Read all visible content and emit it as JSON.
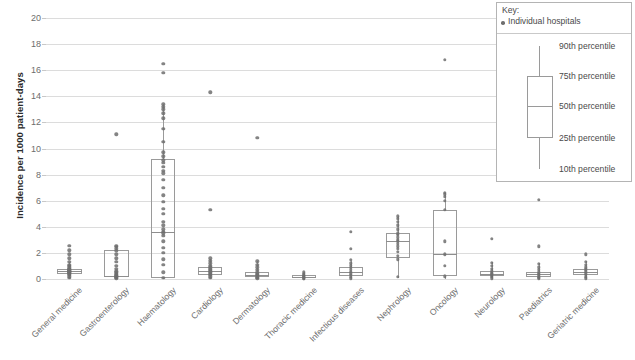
{
  "chart_data": {
    "type": "box",
    "title": "",
    "xlabel": "",
    "ylabel": "Incidence per 1000 patient-days",
    "ylim": [
      0,
      20
    ],
    "ytick_values": [
      0,
      2,
      4,
      6,
      8,
      10,
      12,
      14,
      16,
      18,
      20
    ],
    "ytick_labels": [
      "0",
      "2",
      "4",
      "6",
      "8",
      "10",
      "12",
      "14",
      "16",
      "18",
      "20"
    ],
    "grid": true,
    "legend_position": "top-right",
    "categories": [
      "General medicine",
      "Gastroenterology",
      "Haematology",
      "Cardiology",
      "Dermatology",
      "Thoracic medicine",
      "Infectious diseases",
      "Nephrology",
      "Oncology",
      "Neurology",
      "Paediatrics",
      "Geriatric medicine"
    ],
    "boxes": [
      {
        "category": "General medicine",
        "p10": 0.0,
        "p25": 0.35,
        "p50": 0.6,
        "p75": 0.8,
        "p90": 1.3,
        "points": [
          0.1,
          0.2,
          0.3,
          0.4,
          0.45,
          0.5,
          0.55,
          0.6,
          0.6,
          0.65,
          0.7,
          0.75,
          0.8,
          0.9,
          1.0,
          1.1,
          1.3,
          1.6,
          1.9,
          2.2,
          2.55
        ]
      },
      {
        "category": "Gastroenterology",
        "p10": 0.0,
        "p25": 0.15,
        "p50": 0.25,
        "p75": 2.2,
        "p90": 2.5,
        "points": [
          0.05,
          0.1,
          0.15,
          0.2,
          0.25,
          0.3,
          0.4,
          0.5,
          0.6,
          0.8,
          1.0,
          1.3,
          1.6,
          1.9,
          2.15,
          2.3,
          2.45,
          2.55,
          11.1
        ]
      },
      {
        "category": "Haematology",
        "p10": 0.0,
        "p25": 0.1,
        "p50": 3.6,
        "p75": 9.2,
        "p90": 13.4,
        "points": [
          0.1,
          0.5,
          1.1,
          1.5,
          2.0,
          2.4,
          2.9,
          3.3,
          3.5,
          3.6,
          3.8,
          4.1,
          4.4,
          5.0,
          5.4,
          5.9,
          6.4,
          7.0,
          7.6,
          8.1,
          8.3,
          8.6,
          8.9,
          9.1,
          9.4,
          9.7,
          10.5,
          11.5,
          12.3,
          12.7,
          13.0,
          13.2,
          13.4,
          15.8,
          16.5
        ]
      },
      {
        "category": "Cardiology",
        "p10": 0.0,
        "p25": 0.3,
        "p50": 0.6,
        "p75": 0.95,
        "p90": 1.5,
        "points": [
          0.1,
          0.2,
          0.3,
          0.4,
          0.5,
          0.6,
          0.7,
          0.8,
          0.9,
          1.0,
          1.2,
          1.4,
          1.6,
          5.3,
          14.3
        ]
      },
      {
        "category": "Dermatology",
        "p10": 0.0,
        "p25": 0.15,
        "p50": 0.3,
        "p75": 0.5,
        "p90": 1.4,
        "points": [
          0.05,
          0.1,
          0.2,
          0.3,
          0.4,
          0.5,
          0.7,
          0.9,
          1.1,
          1.35,
          10.8
        ]
      },
      {
        "category": "Thoracic medicine",
        "p10": 0.0,
        "p25": 0.05,
        "p50": 0.15,
        "p75": 0.3,
        "p90": 0.5,
        "points": [
          0.0,
          0.05,
          0.1,
          0.15,
          0.2,
          0.25,
          0.3,
          0.4,
          0.5
        ]
      },
      {
        "category": "Infectious diseases",
        "p10": 0.0,
        "p25": 0.2,
        "p50": 0.55,
        "p75": 0.9,
        "p90": 1.4,
        "points": [
          0.05,
          0.15,
          0.3,
          0.45,
          0.55,
          0.7,
          0.85,
          1.0,
          1.2,
          1.45,
          2.3,
          3.6
        ]
      },
      {
        "category": "Nephrology",
        "p10": 0.1,
        "p25": 1.6,
        "p50": 2.9,
        "p75": 3.5,
        "p90": 4.8,
        "points": [
          0.15,
          1.5,
          1.8,
          2.1,
          2.3,
          2.5,
          2.7,
          2.9,
          3.0,
          3.2,
          3.4,
          3.5,
          3.8,
          4.1,
          4.4,
          4.6,
          4.8
        ]
      },
      {
        "category": "Oncology",
        "p10": 0.0,
        "p25": 0.25,
        "p50": 1.9,
        "p75": 5.3,
        "p90": 6.6,
        "points": [
          0.2,
          1.0,
          1.9,
          2.9,
          5.3,
          6.0,
          6.3,
          6.5,
          6.6,
          16.8
        ]
      },
      {
        "category": "Neurology",
        "p10": 0.0,
        "p25": 0.2,
        "p50": 0.4,
        "p75": 0.6,
        "p90": 1.3,
        "points": [
          0.05,
          0.15,
          0.25,
          0.35,
          0.45,
          0.6,
          0.8,
          1.0,
          1.25,
          3.1
        ]
      },
      {
        "category": "Paediatrics",
        "p10": 0.0,
        "p25": 0.15,
        "p50": 0.35,
        "p75": 0.55,
        "p90": 1.2,
        "points": [
          0.05,
          0.1,
          0.2,
          0.3,
          0.4,
          0.5,
          0.7,
          0.9,
          1.15,
          2.5,
          6.05
        ]
      },
      {
        "category": "Geriatric medicine",
        "p10": 0.0,
        "p25": 0.3,
        "p50": 0.55,
        "p75": 0.8,
        "p90": 1.4,
        "points": [
          0.05,
          0.15,
          0.3,
          0.45,
          0.6,
          0.75,
          0.9,
          1.1,
          1.3,
          1.9
        ]
      }
    ],
    "legend": {
      "title": "Key:",
      "individual_label": "Individual hospitals",
      "percentile_labels": [
        "90th percentile",
        "75th percentile",
        "50th percentile",
        "25th percentile",
        "10th percentile"
      ]
    },
    "colors": {
      "point": "#6f6f6f",
      "box_border": "#9a9a9a",
      "gridline": "#dcdcdc",
      "axis_text": "#6d6d6d",
      "label_text": "#2b2b2b",
      "legend_border": "#b4b4b4"
    }
  }
}
